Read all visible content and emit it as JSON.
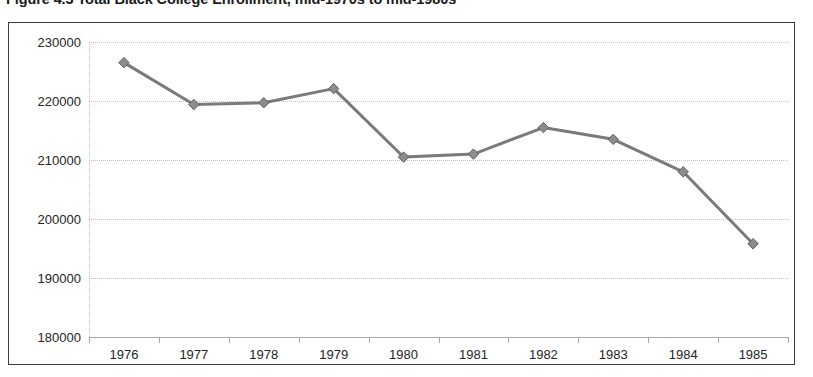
{
  "figure": {
    "caption": "Figure 4.3  Total Black College Enrollment, mid-1970s to mid-1980s"
  },
  "colors": {
    "series_line": "#7a7a7a",
    "series_marker": "#8c8c8c",
    "marker_edge": "#5f5f5f",
    "frame_border": "#3d3d3d",
    "gridline": "#bfbfbf",
    "axis_line": "#a8a8a8",
    "text": "#242424",
    "background": "#ffffff"
  },
  "chart_data": {
    "type": "line",
    "title": "Figure 4.3  Total Black College Enrollment, mid-1970s to mid-1980s",
    "xlabel": "",
    "ylabel": "",
    "categories": [
      "1976",
      "1977",
      "1978",
      "1979",
      "1980",
      "1981",
      "1982",
      "1983",
      "1984",
      "1985"
    ],
    "values": [
      226500,
      219400,
      219700,
      222100,
      210500,
      211000,
      215500,
      213500,
      208000,
      195800
    ],
    "series": [
      {
        "name": "Total Black College Enrollment",
        "values": [
          226500,
          219400,
          219700,
          222100,
          210500,
          211000,
          215500,
          213500,
          208000,
          195800
        ]
      }
    ],
    "ylim": [
      180000,
      230000
    ],
    "ytick_step": 10000,
    "yticks": [
      230000,
      220000,
      210000,
      200000,
      190000,
      180000
    ],
    "ytick_labels": [
      "230000",
      "220000",
      "210000",
      "200000",
      "190000",
      "180000"
    ],
    "xtick_labels": [
      "1976",
      "1977",
      "1978",
      "1979",
      "1980",
      "1981",
      "1982",
      "1983",
      "1984",
      "1985"
    ],
    "grid": true,
    "grid_axis": "y",
    "legend": false,
    "legend_position": "none",
    "marker": "diamond",
    "line_width": 3
  }
}
